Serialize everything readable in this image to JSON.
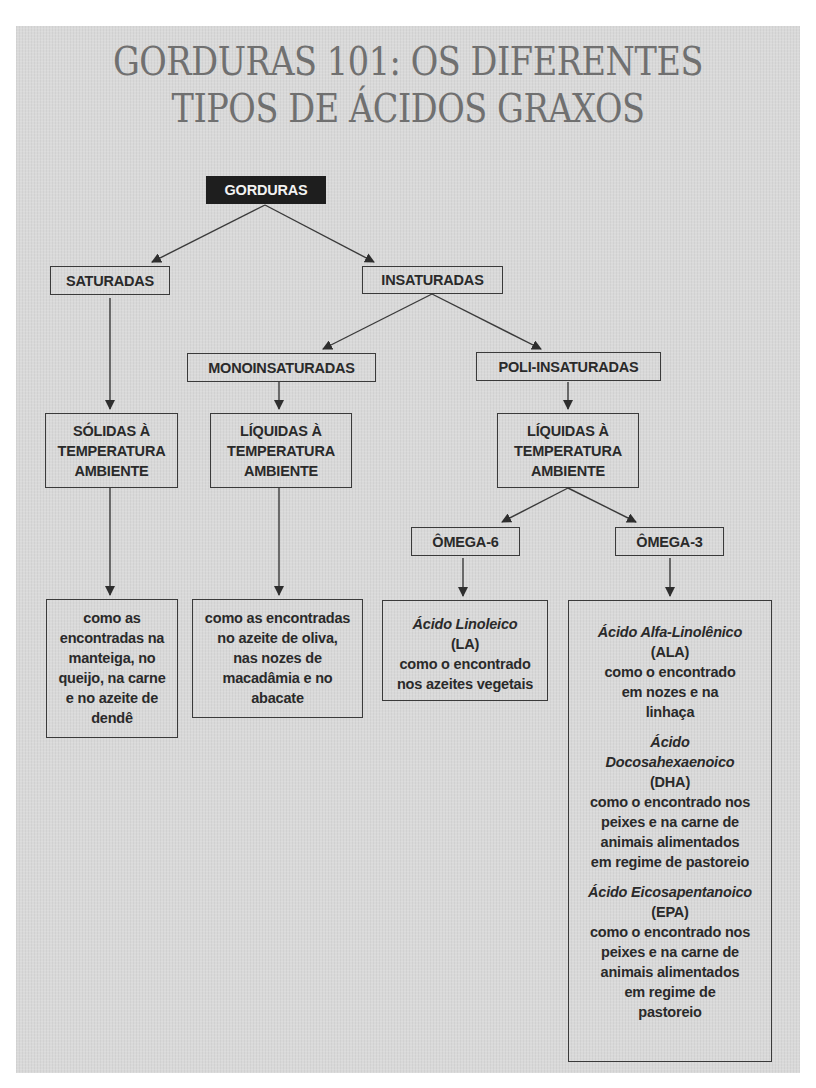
{
  "title": {
    "line1": "GORDURAS 101: OS DIFERENTES",
    "line2": "TIPOS DE ÁCIDOS GRAXOS"
  },
  "colors": {
    "panel_bg": "#d9d9d9",
    "title_text": "#707070",
    "root_bg": "#1e1e1e",
    "root_text": "#f2f2f2",
    "border": "#3a3a3a",
    "text": "#2a2a2a"
  },
  "diagram": {
    "root": "GORDURAS",
    "saturated": {
      "label": "SATURADAS",
      "state": [
        "SÓLIDAS À",
        "TEMPERATURA",
        "AMBIENTE"
      ],
      "examples": [
        "como as",
        "encontradas na",
        "manteiga, no",
        "queijo, na carne",
        "e no azeite de",
        "dendê"
      ]
    },
    "unsaturated": {
      "label": "INSATURADAS",
      "mono": {
        "label": "MONOINSATURADAS",
        "state": [
          "LÍQUIDAS À",
          "TEMPERATURA",
          "AMBIENTE"
        ],
        "examples": [
          "como as encontradas",
          "no azeite de oliva,",
          "nas nozes de",
          "macadâmia e no",
          "abacate"
        ]
      },
      "poly": {
        "label": "POLI-INSATURADAS",
        "state": [
          "LÍQUIDAS À",
          "TEMPERATURA",
          "AMBIENTE"
        ],
        "omega6": {
          "label": "ÔMEGA-6",
          "acids": [
            {
              "name": "Ácido Linoleico",
              "abbr": "(LA)",
              "source": [
                "como o encontrado",
                "nos azeites vegetais"
              ]
            }
          ]
        },
        "omega3": {
          "label": "ÔMEGA-3",
          "acids": [
            {
              "name": [
                "Ácido Alfa-Linolênico"
              ],
              "abbr": "(ALA)",
              "source": [
                "como o encontrado",
                "em nozes e na",
                "linhaça"
              ]
            },
            {
              "name": [
                "Ácido",
                "Docosahexaenoico"
              ],
              "abbr": "(DHA)",
              "source": [
                "como o encontrado nos",
                "peixes e na carne de",
                "animais alimentados",
                "em regime de pastoreio"
              ]
            },
            {
              "name": [
                "Ácido Eicosapentanoico"
              ],
              "abbr": "(EPA)",
              "source": [
                "como o encontrado nos",
                "peixes e na carne de",
                "animais alimentados",
                "em regime de",
                "pastoreio"
              ]
            }
          ]
        }
      }
    }
  }
}
